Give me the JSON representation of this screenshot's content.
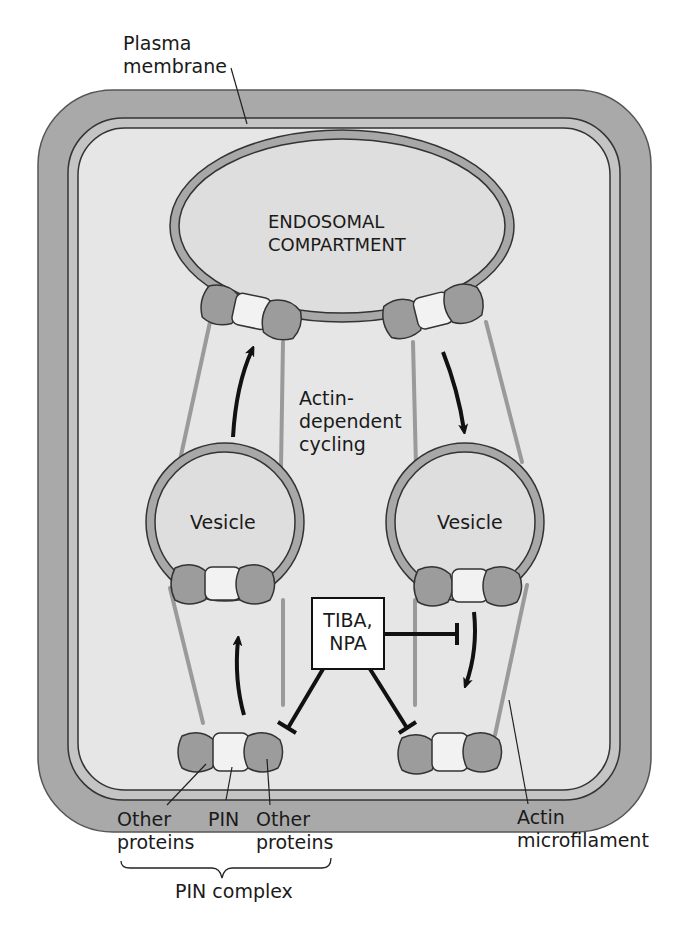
{
  "labels": {
    "plasma_membrane_line1": "Plasma",
    "plasma_membrane_line2": "membrane",
    "endosome_line1": "ENDOSOMAL",
    "endosome_line2": "COMPARTMENT",
    "cycling_line1": "Actin-",
    "cycling_line2": "dependent",
    "cycling_line3": "cycling",
    "vesicle_left": "Vesicle",
    "vesicle_right": "Vesicle",
    "inhibitor_line1": "TIBA,",
    "inhibitor_line2": "NPA",
    "other_proteins_left_line1": "Other",
    "other_proteins_left_line2": "proteins",
    "pin": "PIN",
    "other_proteins_right_line1": "Other",
    "other_proteins_right_line2": "proteins",
    "pin_complex": "PIN complex",
    "actin_line1": "Actin",
    "actin_line2": "microfilament"
  },
  "colors": {
    "cell_wall": "#a9a9a9",
    "membrane_band": "#c4c4c4",
    "cytoplasm": "#e6e6e6",
    "organelle_fill": "#dedede",
    "organelle_membrane": "#a8a8a8",
    "other_protein": "#9c9c9c",
    "pin_protein": "#f2f2f2",
    "actin": "#9a9a9a",
    "outline": "#333333",
    "arrow": "#111111"
  }
}
